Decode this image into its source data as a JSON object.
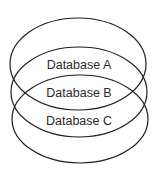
{
  "diagram": {
    "type": "overlapping-ellipses",
    "sets": [
      {
        "label": "Database A"
      },
      {
        "label": "Database B"
      },
      {
        "label": "Database C"
      }
    ],
    "stroke_color": "#1e1e1e",
    "text_color": "#2a2a2a",
    "background": "#ffffff"
  }
}
